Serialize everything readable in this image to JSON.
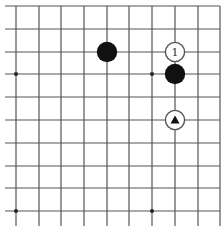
{
  "diagram": {
    "type": "go-board-fragment",
    "colors": {
      "background": "#ffffff",
      "grid_line": "#555555",
      "black_stone": "#111111",
      "white_stone_fill": "#ffffff",
      "white_stone_border": "#555555",
      "marker": "#111111"
    },
    "grid": {
      "columns_x": [
        16,
        39,
        61,
        84,
        107,
        129,
        152,
        175,
        198,
        220
      ],
      "rows_y": [
        6,
        29,
        52,
        74,
        97,
        120,
        143,
        166,
        188,
        211
      ],
      "top_edge": true,
      "right_edge": true
    },
    "star_points": [
      {
        "col": 0,
        "row": 3
      },
      {
        "col": 6,
        "row": 3
      },
      {
        "col": 0,
        "row": 9
      },
      {
        "col": 6,
        "row": 9
      }
    ],
    "stones": [
      {
        "color": "black",
        "col": 4,
        "row": 2,
        "label": ""
      },
      {
        "color": "white",
        "col": 7,
        "row": 2,
        "label": "1"
      },
      {
        "color": "black",
        "col": 7,
        "row": 3,
        "label": ""
      },
      {
        "color": "white",
        "col": 7,
        "row": 5,
        "label": "",
        "marker": "triangle"
      }
    ]
  }
}
